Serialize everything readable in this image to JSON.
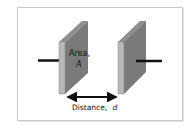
{
  "diagram": {
    "labels": {
      "area_line1": "Area,",
      "area_line2": "A",
      "distance_prefix": "Distance,",
      "distance_var": "d"
    },
    "colors": {
      "plate_face": "#7a7a7a",
      "plate_edge": "#b8b8b8",
      "plate_top": "#8e8e8e",
      "wire": "#111111",
      "frame_border": "#c8c8c8",
      "background": "#ffffff"
    }
  }
}
